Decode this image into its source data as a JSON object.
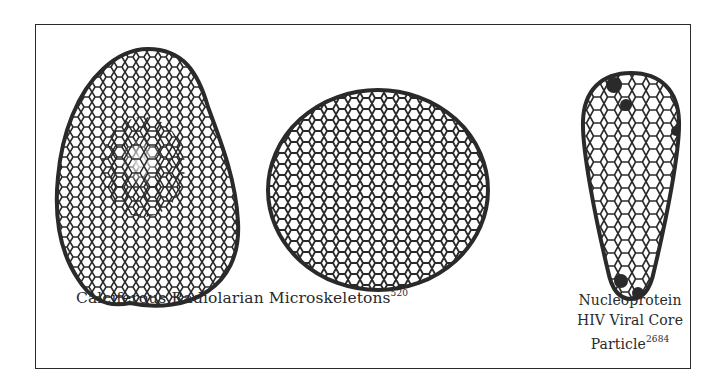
{
  "figure": {
    "items": [
      {
        "name": "calciferous-radiolarian-microskeleton-ovoid",
        "shape": "irregular ovoid, lumpy base"
      },
      {
        "name": "calciferous-radiolarian-microskeleton-sphere",
        "shape": "sphere"
      },
      {
        "name": "hiv-viral-core-particle",
        "shape": "cone / teardrop"
      }
    ],
    "captions": {
      "main": {
        "text": "Calciferous Radiolarian Microskeletons",
        "ref": "520"
      },
      "right": {
        "line1": "Nucleoprotein",
        "line2": "HIV Viral Core",
        "line3": "Particle",
        "ref": "2684"
      }
    }
  },
  "colors": {
    "ink": "#2a2a2a",
    "paper": "#ffffff"
  }
}
